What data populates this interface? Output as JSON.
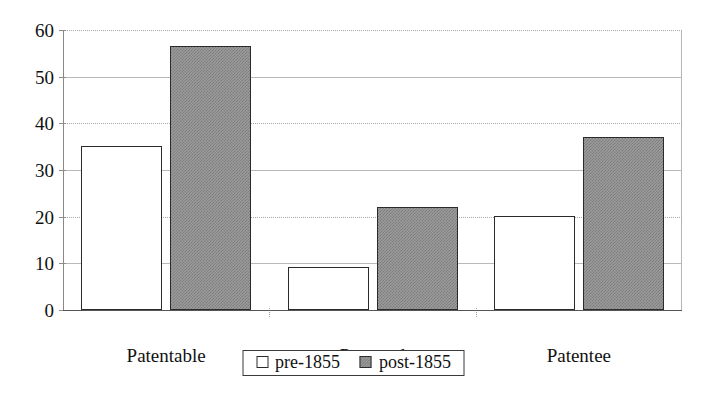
{
  "chart_data": {
    "type": "bar",
    "title": "",
    "subtitle": "",
    "xlabel": "",
    "ylabel": "",
    "categories": [
      "Patentable",
      "Patented",
      "Patentee"
    ],
    "series": [
      {
        "name": "pre-1855",
        "values": [
          35.2,
          9.3,
          20.1
        ],
        "fill": "white",
        "edge": "#2b2b2b"
      },
      {
        "name": "post-1855",
        "values": [
          56.5,
          22.0,
          37.0
        ],
        "fill": "#9b9b9b",
        "edge": "#2b2b2b"
      }
    ],
    "ylim": [
      0,
      60
    ],
    "ytick_labels": [
      "0",
      "10",
      "20",
      "30",
      "40",
      "50",
      "60"
    ],
    "ytick_values": [
      0,
      10,
      20,
      30,
      40,
      50,
      60
    ],
    "grid": true,
    "grid_axis": "y",
    "legend_position": "below-center",
    "legend_entries": [
      "pre-1855",
      "post-1855"
    ]
  },
  "axes": {
    "y": {
      "ticks": [
        {
          "label": "0",
          "value": 0
        },
        {
          "label": "10",
          "value": 10
        },
        {
          "label": "20",
          "value": 20
        },
        {
          "label": "30",
          "value": 30
        },
        {
          "label": "40",
          "value": 40
        },
        {
          "label": "50",
          "value": 50
        },
        {
          "label": "60",
          "value": 60
        }
      ]
    },
    "x": {
      "categories": [
        {
          "label": "Patentable"
        },
        {
          "label": "Patented"
        },
        {
          "label": "Patentee"
        }
      ]
    }
  },
  "legend": {
    "entries": [
      {
        "label": "pre-1855",
        "style": "pre"
      },
      {
        "label": "post-1855",
        "style": "post"
      }
    ]
  }
}
